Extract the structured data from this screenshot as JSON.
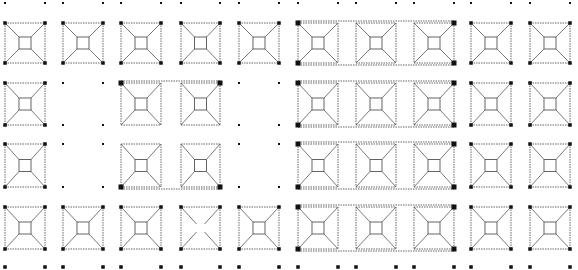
{
  "diagram": {
    "title": "",
    "colors": {
      "background": "#ffffff",
      "line": "#555555",
      "column": "#111111"
    },
    "columns_x": [
      [
        5,
        45
      ],
      [
        63,
        103
      ],
      [
        121,
        161
      ],
      [
        181,
        220
      ],
      [
        239,
        279
      ],
      [
        298,
        338
      ],
      [
        356,
        396
      ],
      [
        414,
        454
      ],
      [
        471,
        511
      ],
      [
        530,
        570
      ]
    ],
    "rows_y": [
      [
        23,
        63
      ],
      [
        83,
        125
      ],
      [
        144,
        187
      ],
      [
        207,
        249
      ]
    ],
    "top_markers_y": 3,
    "bottom_markers_y": 267,
    "modules": [
      {
        "row": 0,
        "col": 0,
        "type": "pyramid"
      },
      {
        "row": 0,
        "col": 1,
        "type": "pyramid"
      },
      {
        "row": 0,
        "col": 2,
        "type": "pyramid"
      },
      {
        "row": 0,
        "col": 3,
        "type": "pyramid"
      },
      {
        "row": 0,
        "col": 4,
        "type": "pyramid"
      },
      {
        "row": 0,
        "col": 5,
        "type": "pyramid",
        "group": "A"
      },
      {
        "row": 0,
        "col": 6,
        "type": "pyramid",
        "group": "A"
      },
      {
        "row": 0,
        "col": 7,
        "type": "pyramid",
        "group": "A"
      },
      {
        "row": 0,
        "col": 8,
        "type": "pyramid"
      },
      {
        "row": 0,
        "col": 9,
        "type": "pyramid"
      },
      {
        "row": 1,
        "col": 0,
        "type": "pyramid"
      },
      {
        "row": 1,
        "col": 1,
        "type": "empty"
      },
      {
        "row": 1,
        "col": 2,
        "type": "pyramid",
        "group": "C"
      },
      {
        "row": 1,
        "col": 3,
        "type": "pyramid",
        "group": "C"
      },
      {
        "row": 1,
        "col": 4,
        "type": "empty"
      },
      {
        "row": 1,
        "col": 5,
        "type": "pyramid",
        "group": "B"
      },
      {
        "row": 1,
        "col": 6,
        "type": "pyramid",
        "group": "B"
      },
      {
        "row": 1,
        "col": 7,
        "type": "pyramid",
        "group": "B"
      },
      {
        "row": 1,
        "col": 8,
        "type": "pyramid"
      },
      {
        "row": 1,
        "col": 9,
        "type": "pyramid"
      },
      {
        "row": 2,
        "col": 0,
        "type": "pyramid"
      },
      {
        "row": 2,
        "col": 1,
        "type": "empty"
      },
      {
        "row": 2,
        "col": 2,
        "type": "pyramid",
        "group": "C"
      },
      {
        "row": 2,
        "col": 3,
        "type": "pyramid",
        "group": "C"
      },
      {
        "row": 2,
        "col": 4,
        "type": "empty"
      },
      {
        "row": 2,
        "col": 5,
        "type": "pyramid",
        "group": "D"
      },
      {
        "row": 2,
        "col": 6,
        "type": "pyramid",
        "group": "D"
      },
      {
        "row": 2,
        "col": 7,
        "type": "pyramid",
        "group": "D"
      },
      {
        "row": 2,
        "col": 8,
        "type": "pyramid"
      },
      {
        "row": 2,
        "col": 9,
        "type": "pyramid"
      },
      {
        "row": 3,
        "col": 0,
        "type": "pyramid"
      },
      {
        "row": 3,
        "col": 1,
        "type": "pyramid"
      },
      {
        "row": 3,
        "col": 2,
        "type": "pyramid"
      },
      {
        "row": 3,
        "col": 3,
        "type": "cross"
      },
      {
        "row": 3,
        "col": 4,
        "type": "pyramid"
      },
      {
        "row": 3,
        "col": 5,
        "type": "pyramid",
        "group": "E"
      },
      {
        "row": 3,
        "col": 6,
        "type": "pyramid",
        "group": "E"
      },
      {
        "row": 3,
        "col": 7,
        "type": "pyramid",
        "group": "E"
      },
      {
        "row": 3,
        "col": 8,
        "type": "pyramid"
      },
      {
        "row": 3,
        "col": 9,
        "type": "pyramid"
      }
    ]
  }
}
